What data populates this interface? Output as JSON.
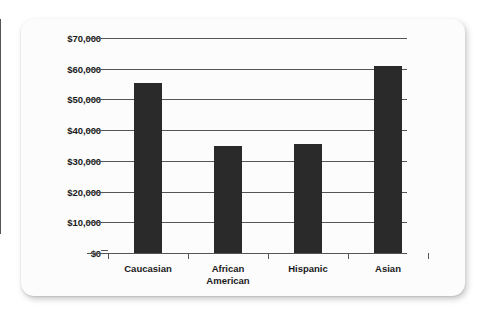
{
  "chart_data": {
    "type": "bar",
    "title": "",
    "subtitle": "",
    "xlabel": "",
    "ylabel": "",
    "categories": [
      "Caucasian",
      "African American",
      "Hispanic",
      "Asian"
    ],
    "category_lines": [
      [
        "Caucasian"
      ],
      [
        "African",
        "American"
      ],
      [
        "Hispanic"
      ],
      [
        "Asian"
      ]
    ],
    "values": [
      55500,
      35000,
      35400,
      60800
    ],
    "ylim": [
      0,
      70000
    ],
    "ytick_values": [
      0,
      10000,
      20000,
      30000,
      40000,
      50000,
      60000,
      70000
    ],
    "ytick_labels": [
      "$0",
      "$10,000",
      "$20,000",
      "$30,000",
      "$40,000",
      "$50,000",
      "$60,000",
      "$70,000"
    ],
    "grid": true,
    "grid_axis": "y",
    "legend": false,
    "legend_position": "none",
    "bar_color": "#2a2a2a",
    "axis_color": "#555555",
    "plot_background": "#fcfcfc",
    "page_background": "#ffffff"
  }
}
